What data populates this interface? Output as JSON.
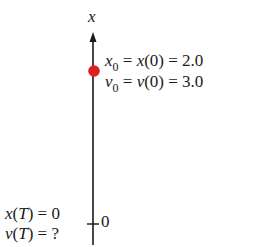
{
  "diagram": {
    "axis": {
      "label": "x",
      "tick_label": "0",
      "line_color": "#1a1a1a"
    },
    "initial_point": {
      "color": "#e0201e",
      "eq1": {
        "var": "x",
        "sub": "0",
        "mid": " = ",
        "func": "x",
        "arg": "(0)",
        "rhs": " = 2.0"
      },
      "eq2": {
        "var": "v",
        "sub": "0",
        "mid": " = ",
        "func": "v",
        "arg": "(0)",
        "rhs": " = 3.0"
      }
    },
    "final_point": {
      "eq1": {
        "func": "x",
        "arg_open": "(",
        "arg": "T",
        "arg_close": ")",
        "rhs": " = 0"
      },
      "eq2": {
        "func": "v",
        "arg_open": "(",
        "arg": "T",
        "arg_close": ")",
        "rhs": " = ?"
      }
    }
  }
}
